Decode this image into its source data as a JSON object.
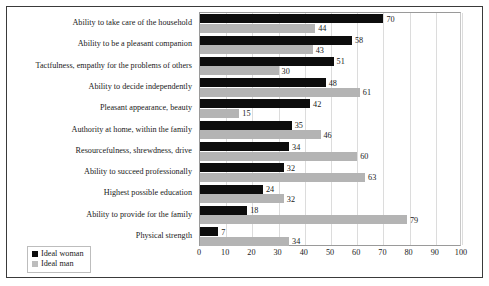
{
  "chart_data": {
    "type": "bar",
    "orientation": "horizontal",
    "title": "",
    "xlabel": "",
    "ylabel": "",
    "xlim": [
      0,
      100
    ],
    "xticks": [
      0,
      10,
      20,
      30,
      40,
      50,
      60,
      70,
      80,
      90,
      100
    ],
    "grid": true,
    "legend_position": "bottom-left",
    "categories": [
      "Ability to take care of the household",
      "Ability to be a pleasant companion",
      "Tactfulness, empathy for the problems of others",
      "Ability to decide independently",
      "Pleasant appearance, beauty",
      "Authority at home, within the family",
      "Resourcefulness, shrewdness, drive",
      "Ability to succeed professionally",
      "Highest possible education",
      "Ability to provide for the family",
      "Physical strength"
    ],
    "series": [
      {
        "name": "Ideal woman",
        "color": "#0d0d0d",
        "values": [
          70,
          58,
          51,
          48,
          42,
          35,
          34,
          32,
          24,
          18,
          7
        ]
      },
      {
        "name": "Ideal man",
        "color": "#b4b4b4",
        "values": [
          44,
          43,
          30,
          61,
          15,
          46,
          60,
          63,
          32,
          79,
          34
        ]
      }
    ]
  },
  "legend": {
    "items": [
      {
        "label": "Ideal woman",
        "swatch": "woman"
      },
      {
        "label": "Ideal man",
        "swatch": "man"
      }
    ]
  }
}
